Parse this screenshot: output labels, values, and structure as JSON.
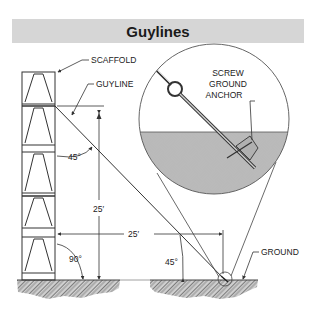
{
  "title": "Guylines",
  "labels": {
    "scaffold": "SCAFFOLD",
    "guyline": "GUYLINE",
    "screw_anchor_line1": "SCREW",
    "screw_anchor_line2": "GROUND",
    "screw_anchor_line3": "ANCHOR",
    "ground": "GROUND"
  },
  "dimensions": {
    "vertical": "25′",
    "horizontal": "25′"
  },
  "angles": {
    "scaffold_to_guyline": "45°",
    "scaffold_to_ground": "90°",
    "guyline_to_ground": "45°"
  },
  "colors": {
    "title_bg": "#d6d6d6",
    "line": "#333333",
    "ground_fill": "#9a9a9a",
    "anchor_fill": "#b0b0b0"
  }
}
